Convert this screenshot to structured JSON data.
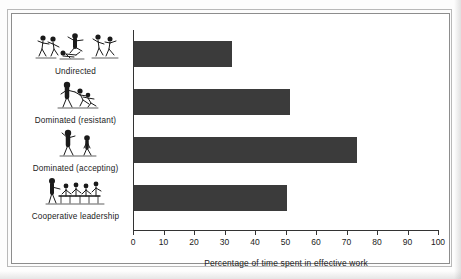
{
  "chart_data": {
    "type": "bar",
    "orientation": "horizontal",
    "title": "",
    "xlabel": "Percentage of time spent in effective work",
    "ylabel": "",
    "xlim": [
      0,
      100
    ],
    "grid": false,
    "legend": null,
    "categories": [
      "Undirected",
      "Dominated (resistant)",
      "Dominated (accepting)",
      "Cooperative leadership"
    ],
    "values": [
      32,
      51,
      73,
      50
    ],
    "tick_labels": [
      "0",
      "10",
      "20",
      "30",
      "40",
      "50",
      "60",
      "70",
      "80",
      "90",
      "100"
    ],
    "tick_values": [
      0,
      10,
      20,
      30,
      40,
      50,
      60,
      70,
      80,
      90,
      100
    ],
    "bar_color": "#3b3b3b",
    "axis_color": "#333333",
    "category_icons": [
      "undirected-group-icon",
      "dominated-resistant-icon",
      "dominated-accepting-icon",
      "cooperative-leadership-icon"
    ]
  }
}
